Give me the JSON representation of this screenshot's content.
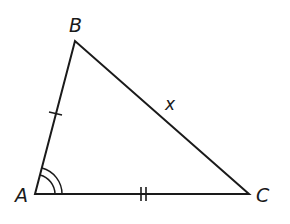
{
  "figure": {
    "type": "triangle",
    "vertices": {
      "A": {
        "label": "A",
        "x": 35,
        "y": 194
      },
      "B": {
        "label": "B",
        "x": 75,
        "y": 41
      },
      "C": {
        "label": "C",
        "x": 249,
        "y": 194
      }
    },
    "side_labels": {
      "BC": "x"
    },
    "markings": {
      "AB": "single tick",
      "AC": "double tick",
      "angle_A": "double arc"
    },
    "stroke_color": "#1a1a1a"
  }
}
